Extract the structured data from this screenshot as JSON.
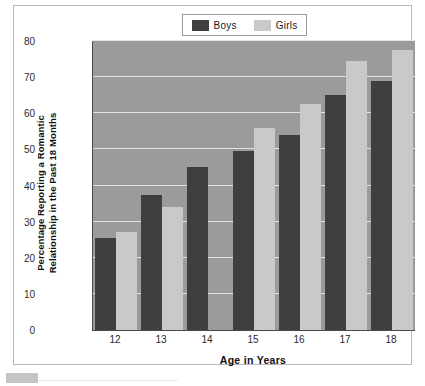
{
  "chart_data": {
    "type": "bar",
    "title": "",
    "xlabel": "Age in Years",
    "ylabel": "Percentage Reporting a Romantic Relationship in the Past 18 Months",
    "categories": [
      "12",
      "13",
      "14",
      "15",
      "16",
      "17",
      "18"
    ],
    "series": [
      {
        "name": "Boys",
        "color": "#3f3f3f",
        "values": [
          25.5,
          37.5,
          45,
          49.5,
          54,
          65,
          69
        ]
      },
      {
        "name": "Girls",
        "color": "#c9c9c9",
        "values": [
          27,
          34,
          0,
          56,
          62.5,
          74.5,
          77.5
        ]
      }
    ],
    "ylim": [
      0,
      80
    ],
    "ytick_values": [
      0,
      10,
      20,
      30,
      40,
      50,
      60,
      70,
      80
    ],
    "ytick_labels": [
      "0",
      "10",
      "20",
      "30",
      "40",
      "50",
      "60",
      "70",
      "80"
    ],
    "grid": true,
    "legend_position": "top-center",
    "plot_background": "#9b9b9b",
    "gridline_color": "#e2e2e2"
  },
  "ylabel_lines": [
    "Percentage Reporting a Romantic",
    "Relationship in the Past 18 Months"
  ],
  "legend": {
    "items": [
      {
        "label": "Boys",
        "color": "#3f3f3f"
      },
      {
        "label": "Girls",
        "color": "#c9c9c9"
      }
    ]
  }
}
